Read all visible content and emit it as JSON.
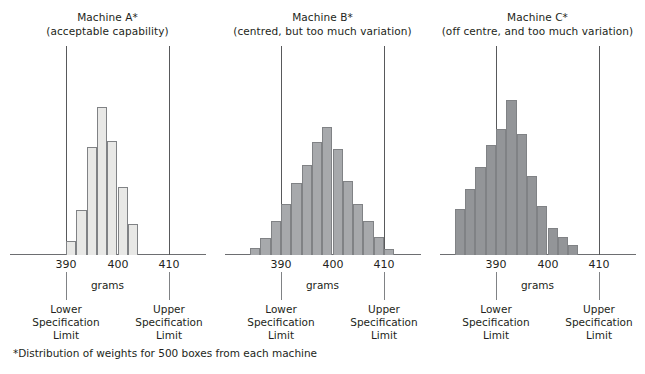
{
  "figure": {
    "footnote": "*Distribution of weights for 500 boxes from each machine",
    "axis_title": "grams",
    "lower_spec_caption": [
      "Lower",
      "Specification",
      "Limit"
    ],
    "upper_spec_caption": [
      "Upper",
      "Specification",
      "Limit"
    ],
    "tick_labels": [
      "390",
      "400",
      "410"
    ],
    "colors": {
      "bar_a": "#e8e8e6",
      "bar_b": "#a7a9ac",
      "bar_c": "#939598",
      "bar_edge": "#808285",
      "axis": "#6d6e71",
      "spec_line": "#58595b",
      "text": "#231f20"
    }
  },
  "chart_data": [
    {
      "type": "bar",
      "title": "Machine A*",
      "subtitle": "(acceptable capability)",
      "xlabel": "grams",
      "ylabel": "",
      "xlim": [
        385,
        415
      ],
      "xticks": [
        390,
        400,
        410
      ],
      "grid": false,
      "legend": "none",
      "bin_width": 2,
      "bin_centers": [
        391,
        393,
        395,
        397,
        399,
        401,
        403
      ],
      "values": [
        12,
        40,
        96,
        131,
        101,
        60,
        27
      ],
      "annotations": {
        "lower_specification_limit": 390,
        "upper_specification_limit": 410
      }
    },
    {
      "type": "bar",
      "title": "Machine B*",
      "subtitle": "(centred, but too much variation)",
      "xlabel": "grams",
      "ylabel": "",
      "xlim": [
        385,
        415
      ],
      "xticks": [
        390,
        400,
        410
      ],
      "grid": false,
      "legend": "none",
      "bin_width": 2,
      "bin_centers": [
        385,
        387,
        389,
        391,
        393,
        395,
        397,
        399,
        401,
        403,
        405,
        407,
        409,
        411
      ],
      "values": [
        7,
        17,
        33,
        50,
        70,
        88,
        110,
        125,
        104,
        72,
        50,
        33,
        18,
        6
      ],
      "annotations": {
        "lower_specification_limit": 390,
        "upper_specification_limit": 410
      }
    },
    {
      "type": "bar",
      "title": "Machine C*",
      "subtitle": "(off centre, and too much variation)",
      "xlabel": "grams",
      "ylabel": "",
      "xlim": [
        385,
        415
      ],
      "xticks": [
        390,
        400,
        410
      ],
      "grid": false,
      "legend": "none",
      "bin_width": 2,
      "bin_centers": [
        383,
        385,
        387,
        389,
        391,
        393,
        395,
        397,
        399,
        401,
        403,
        405
      ],
      "values": [
        42,
        60,
        80,
        100,
        115,
        141,
        110,
        72,
        45,
        25,
        16,
        9
      ],
      "annotations": {
        "lower_specification_limit": 390,
        "upper_specification_limit": 410
      }
    }
  ]
}
